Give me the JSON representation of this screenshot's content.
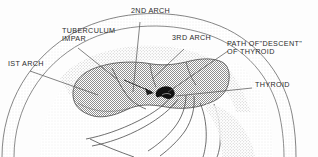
{
  "figure": {
    "type": "anatomical-line-diagram",
    "view": "midsagittal section of embryonic head and neck",
    "background_color": "#fdfdfd",
    "ink_color": "#2b2b2b",
    "stipple_fill_color": "#9a9a9a",
    "light_stipple_color": "#cfcfcf",
    "thyroid_color": "#111111"
  },
  "labels": [
    {
      "id": "first-arch",
      "text": "IST ARCH",
      "x": 8,
      "y": 64,
      "leader": "line from label to the left ventral region of the first pharyngeal arch"
    },
    {
      "id": "tuberculum-impar",
      "text": "TUBERCULUM\nIMPAR",
      "x": 62,
      "y": 31,
      "leader": "line descending right to the median tongue bud on the tongue surface"
    },
    {
      "id": "second-arch",
      "text": "2ND ARCH",
      "x": 131,
      "y": 11,
      "leader": "vertical line descending to the second arch of the tongue dorsum"
    },
    {
      "id": "third-arch",
      "text": "3RD ARCH",
      "x": 172,
      "y": 38,
      "leader": "line descending left to the third arch region"
    },
    {
      "id": "path-of-descent-of-thyroid",
      "text": "PATH OF\"DESCENT\"\nOF THYROID",
      "x": 227,
      "y": 44,
      "leader": "line descending left toward the thyroglossal tract"
    },
    {
      "id": "thyroid",
      "text": "THYROID",
      "x": 255,
      "y": 85,
      "leader": "line running left to the black thyroid primordium"
    }
  ],
  "structures": [
    {
      "id": "head-outline",
      "name": "outer head and neck contour",
      "shading": "light stipple band"
    },
    {
      "id": "tongue-mass",
      "name": "tongue / pharyngeal floor",
      "shading": "medium stipple fill"
    },
    {
      "id": "foramen-cecum-arrow",
      "name": "arrow marking descent from foramen cecum"
    },
    {
      "id": "thyroid-primordium",
      "name": "thyroid primordium",
      "fill": "solid black crescent"
    },
    {
      "id": "pharynx-larynx",
      "name": "pharyngeal and laryngeal lumen outlines"
    }
  ]
}
